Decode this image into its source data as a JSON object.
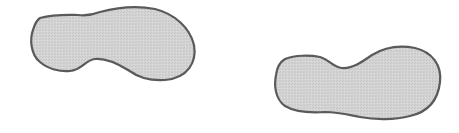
{
  "figure": {
    "colors": {
      "fill": "#d2d2d2",
      "stroke": "#5a5a5a",
      "background": "#ffffff"
    },
    "shapes": [
      {
        "name": "footprint-left",
        "orientation": "heel-left, toe-right, upper"
      },
      {
        "name": "footprint-right",
        "orientation": "heel-left, toe-right, lower"
      }
    ]
  }
}
